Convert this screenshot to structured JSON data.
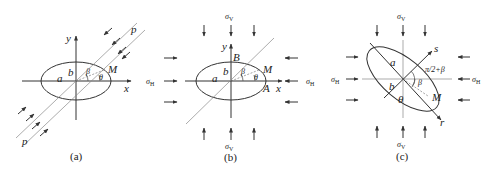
{
  "panels": [
    {
      "id": "a",
      "caption": "(a)",
      "labels": {
        "y": "y",
        "x": "x",
        "a": "a",
        "b": "b",
        "M": "M",
        "beta": "β",
        "theta": "θ",
        "p_top": "p",
        "p_bottom": "p"
      }
    },
    {
      "id": "b",
      "caption": "(b)",
      "labels": {
        "y": "y",
        "x": "x",
        "a": "a",
        "b": "b",
        "M": "M",
        "A": "A",
        "B": "B",
        "beta": "β",
        "theta": "θ",
        "sigma": "σ",
        "sub_V": "V",
        "sub_H": "H"
      }
    },
    {
      "id": "c",
      "caption": "(c)",
      "labels": {
        "a": "a",
        "b": "b",
        "M": "M",
        "r": "r",
        "s": "s",
        "beta": "β",
        "theta": "θ",
        "angle": "π/2+β",
        "sigma": "σ",
        "sub_V": "V",
        "sub_H": "H"
      }
    }
  ]
}
